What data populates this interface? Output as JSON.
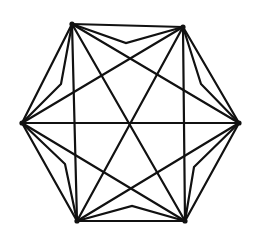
{
  "diagram": {
    "type": "graph",
    "color": "#111111",
    "vertices": [
      "top-left",
      "top-right",
      "right",
      "bottom-right",
      "bottom-left",
      "left"
    ],
    "straight_edges": [
      [
        "top-left",
        "top-right"
      ],
      [
        "top-right",
        "right"
      ],
      [
        "right",
        "bottom-right"
      ],
      [
        "bottom-right",
        "bottom-left"
      ],
      [
        "bottom-left",
        "left"
      ],
      [
        "left",
        "top-left"
      ],
      [
        "top-left",
        "right"
      ],
      [
        "top-left",
        "bottom-right"
      ],
      [
        "top-left",
        "bottom-left"
      ],
      [
        "top-right",
        "left"
      ],
      [
        "top-right",
        "bottom-left"
      ],
      [
        "top-right",
        "bottom-right"
      ],
      [
        "left",
        "right"
      ],
      [
        "left",
        "bottom-right"
      ],
      [
        "right",
        "bottom-left"
      ]
    ],
    "bent_edges": [
      [
        "top-left",
        "top-right"
      ],
      [
        "top-right",
        "right"
      ],
      [
        "right",
        "bottom-right"
      ],
      [
        "bottom-right",
        "bottom-left"
      ],
      [
        "bottom-left",
        "left"
      ],
      [
        "left",
        "top-left"
      ]
    ]
  }
}
